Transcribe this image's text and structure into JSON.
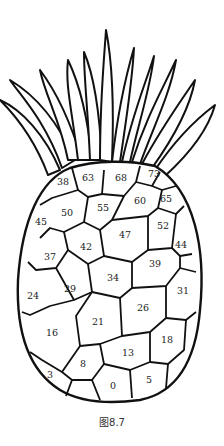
{
  "figure": {
    "caption": "图8.7"
  },
  "scales": [
    {
      "n": "38",
      "x": 63,
      "y": 182
    },
    {
      "n": "63",
      "x": 88,
      "y": 178
    },
    {
      "n": "68",
      "x": 121,
      "y": 178
    },
    {
      "n": "73",
      "x": 154,
      "y": 174
    },
    {
      "n": "50",
      "x": 67,
      "y": 213
    },
    {
      "n": "55",
      "x": 103,
      "y": 208
    },
    {
      "n": "60",
      "x": 140,
      "y": 201
    },
    {
      "n": "65",
      "x": 166,
      "y": 199
    },
    {
      "n": "45",
      "x": 41,
      "y": 222
    },
    {
      "n": "52",
      "x": 163,
      "y": 226
    },
    {
      "n": "47",
      "x": 125,
      "y": 235
    },
    {
      "n": "42",
      "x": 86,
      "y": 247
    },
    {
      "n": "44",
      "x": 181,
      "y": 245
    },
    {
      "n": "37",
      "x": 50,
      "y": 257
    },
    {
      "n": "39",
      "x": 155,
      "y": 264
    },
    {
      "n": "34",
      "x": 113,
      "y": 278
    },
    {
      "n": "29",
      "x": 70,
      "y": 289
    },
    {
      "n": "24",
      "x": 33,
      "y": 296
    },
    {
      "n": "31",
      "x": 183,
      "y": 291
    },
    {
      "n": "26",
      "x": 143,
      "y": 308
    },
    {
      "n": "21",
      "x": 98,
      "y": 322
    },
    {
      "n": "16",
      "x": 52,
      "y": 333
    },
    {
      "n": "18",
      "x": 167,
      "y": 340
    },
    {
      "n": "13",
      "x": 128,
      "y": 353
    },
    {
      "n": "8",
      "x": 83,
      "y": 364
    },
    {
      "n": "3",
      "x": 50,
      "y": 375
    },
    {
      "n": "5",
      "x": 149,
      "y": 380
    },
    {
      "n": "0",
      "x": 113,
      "y": 386
    }
  ]
}
